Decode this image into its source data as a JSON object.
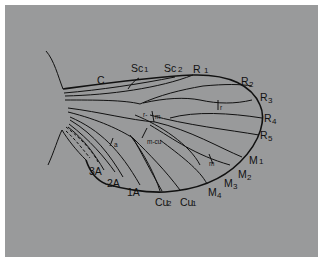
{
  "figure": {
    "background_color": "#999a9b",
    "line_color": "#111111"
  },
  "labels": {
    "costa": {
      "main": "C",
      "sub": ""
    },
    "sc1": {
      "main": "Sc",
      "sub": "1"
    },
    "sc2": {
      "main": "Sc",
      "sub": "2"
    },
    "r1": {
      "main": "R",
      "sub": "1"
    },
    "r2": {
      "main": "R",
      "sub": "2"
    },
    "r3": {
      "main": "R",
      "sub": "3"
    },
    "r4": {
      "main": "R",
      "sub": "4"
    },
    "r5": {
      "main": "R",
      "sub": "5"
    },
    "m1": {
      "main": "M",
      "sub": "1"
    },
    "m2": {
      "main": "M",
      "sub": "2"
    },
    "m3": {
      "main": "M",
      "sub": "3"
    },
    "m4": {
      "main": "M",
      "sub": "4"
    },
    "cu1": {
      "main": "Cu",
      "sub": "1"
    },
    "cu2": {
      "main": "Cu",
      "sub": "2"
    },
    "a1": {
      "main": "1A",
      "sub": ""
    },
    "a2": {
      "main": "2A",
      "sub": ""
    },
    "a3": {
      "main": "3A",
      "sub": ""
    }
  },
  "crossveins": {
    "r": "r",
    "r_m_left": "r-",
    "r_m_right": "m",
    "m_cu": "m-cu",
    "m": "m",
    "a": "a"
  }
}
